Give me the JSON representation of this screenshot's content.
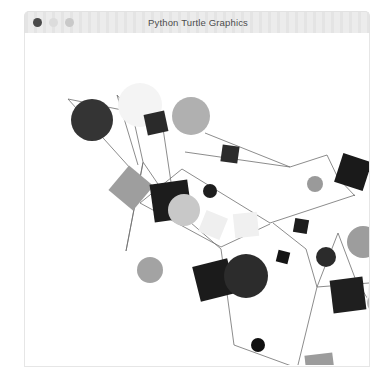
{
  "window": {
    "title": "Python Turtle Graphics",
    "controls": [
      {
        "name": "close",
        "color": "#4a4a4a"
      },
      {
        "name": "minimize",
        "color": "#dcdcdc"
      },
      {
        "name": "maximize",
        "color": "#c9c9c9"
      }
    ],
    "background": "#ffffff",
    "titlebar_color": "#ececec"
  },
  "chart_data": {
    "type": "scatter",
    "title": "Python Turtle Graphics",
    "xlabel": "",
    "ylabel": "",
    "xlim": [
      0,
      344
    ],
    "ylim": [
      0,
      332
    ],
    "grid": false,
    "legend": "none",
    "palette": [
      "#000000",
      "#2e2e2e",
      "#3a3a3a",
      "#7d7d7d",
      "#9a9a9a",
      "#b5b5b5",
      "#cfcfcf",
      "#e8e8e8",
      "#f2f2f2"
    ],
    "edges": [
      {
        "from": [
          43,
          66
        ],
        "to": [
          107,
          79
        ]
      },
      {
        "from": [
          107,
          79
        ],
        "to": [
          92,
          62
        ]
      },
      {
        "from": [
          107,
          79
        ],
        "to": [
          136,
          82
        ]
      },
      {
        "from": [
          107,
          79
        ],
        "to": [
          118,
          129
        ]
      },
      {
        "from": [
          43,
          66
        ],
        "to": [
          115,
          146
        ]
      },
      {
        "from": [
          92,
          62
        ],
        "to": [
          113,
          132
        ]
      },
      {
        "from": [
          136,
          82
        ],
        "to": [
          150,
          176
        ]
      },
      {
        "from": [
          118,
          129
        ],
        "to": [
          101,
          218
        ]
      },
      {
        "from": [
          101,
          218
        ],
        "to": [
          118,
          130
        ]
      },
      {
        "from": [
          180,
          100
        ],
        "to": [
          265,
          134
        ]
      },
      {
        "from": [
          265,
          134
        ],
        "to": [
          302,
          122
        ]
      },
      {
        "from": [
          265,
          134
        ],
        "to": [
          160,
          119
        ]
      },
      {
        "from": [
          302,
          122
        ],
        "to": [
          313,
          145
        ]
      },
      {
        "from": [
          313,
          145
        ],
        "to": [
          330,
          163
        ]
      },
      {
        "from": [
          157,
          136
        ],
        "to": [
          245,
          190
        ]
      },
      {
        "from": [
          245,
          190
        ],
        "to": [
          330,
          162
        ]
      },
      {
        "from": [
          157,
          136
        ],
        "to": [
          115,
          170
        ]
      },
      {
        "from": [
          115,
          170
        ],
        "to": [
          196,
          214
        ]
      },
      {
        "from": [
          196,
          214
        ],
        "to": [
          245,
          191
        ]
      },
      {
        "from": [
          150,
          176
        ],
        "to": [
          196,
          216
        ]
      },
      {
        "from": [
          196,
          216
        ],
        "to": [
          209,
          312
        ]
      },
      {
        "from": [
          209,
          312
        ],
        "to": [
          272,
          335
        ]
      },
      {
        "from": [
          248,
          190
        ],
        "to": [
          281,
          216
        ]
      },
      {
        "from": [
          281,
          216
        ],
        "to": [
          292,
          254
        ]
      },
      {
        "from": [
          292,
          254
        ],
        "to": [
          313,
          200
        ]
      },
      {
        "from": [
          313,
          200
        ],
        "to": [
          330,
          245
        ]
      },
      {
        "from": [
          292,
          254
        ],
        "to": [
          272,
          336
        ]
      },
      {
        "from": [
          292,
          254
        ],
        "to": [
          344,
          250
        ]
      },
      {
        "from": [
          330,
          245
        ],
        "to": [
          344,
          268
        ]
      },
      {
        "from": [
          118,
          129
        ],
        "to": [
          150,
          176
        ]
      }
    ],
    "shapes": [
      {
        "kind": "circle",
        "cx": 67,
        "cy": 87,
        "r": 21,
        "color": "#343434"
      },
      {
        "kind": "circle",
        "cx": 115,
        "cy": 72,
        "r": 22,
        "color": "#f4f4f4"
      },
      {
        "kind": "circle",
        "cx": 166,
        "cy": 83,
        "r": 19,
        "color": "#b0b0b0"
      },
      {
        "kind": "square",
        "cx": 131,
        "cy": 90,
        "size": 21,
        "rot": -12,
        "color": "#2a2a2a"
      },
      {
        "kind": "square",
        "cx": 106,
        "cy": 155,
        "size": 32,
        "rot": 40,
        "color": "#9e9e9e"
      },
      {
        "kind": "square",
        "cx": 146,
        "cy": 168,
        "size": 38,
        "rot": -8,
        "color": "#1c1c1c"
      },
      {
        "kind": "circle",
        "cx": 159,
        "cy": 177,
        "r": 16,
        "color": "#c8c8c8"
      },
      {
        "kind": "square",
        "cx": 205,
        "cy": 121,
        "size": 17,
        "rot": 8,
        "color": "#2b2b2b"
      },
      {
        "kind": "circle",
        "cx": 185,
        "cy": 158,
        "r": 7,
        "color": "#1e1e1e"
      },
      {
        "kind": "circle",
        "cx": 290,
        "cy": 151,
        "r": 8,
        "color": "#9a9a9a"
      },
      {
        "kind": "square",
        "cx": 328,
        "cy": 139,
        "size": 30,
        "rot": 18,
        "color": "#1a1a1a"
      },
      {
        "kind": "square",
        "cx": 360,
        "cy": 162,
        "size": 22,
        "rot": 12,
        "color": "#b5b5b5"
      },
      {
        "kind": "square",
        "cx": 188,
        "cy": 192,
        "size": 23,
        "rot": 22,
        "color": "#efefef"
      },
      {
        "kind": "square",
        "cx": 221,
        "cy": 192,
        "size": 24,
        "rot": -6,
        "color": "#f0f0f0"
      },
      {
        "kind": "square",
        "cx": 276,
        "cy": 193,
        "size": 14,
        "rot": 10,
        "color": "#1d1d1d"
      },
      {
        "kind": "circle",
        "cx": 301,
        "cy": 224,
        "r": 10,
        "color": "#2b2b2b"
      },
      {
        "kind": "circle",
        "cx": 338,
        "cy": 209,
        "r": 16,
        "color": "#9d9d9d"
      },
      {
        "kind": "circle",
        "cx": 125,
        "cy": 237,
        "r": 13,
        "color": "#a3a3a3"
      },
      {
        "kind": "square",
        "cx": 189,
        "cy": 247,
        "size": 36,
        "rot": -14,
        "color": "#1b1b1b"
      },
      {
        "kind": "circle",
        "cx": 221,
        "cy": 243,
        "r": 22,
        "color": "#2c2c2c"
      },
      {
        "kind": "square",
        "cx": 258,
        "cy": 224,
        "size": 12,
        "rot": 14,
        "color": "#151515"
      },
      {
        "kind": "square",
        "cx": 323,
        "cy": 262,
        "size": 33,
        "rot": -7,
        "color": "#1f1f1f"
      },
      {
        "kind": "square",
        "cx": 356,
        "cy": 258,
        "size": 26,
        "rot": 9,
        "color": "#f1f1f1"
      },
      {
        "kind": "circle",
        "cx": 351,
        "cy": 270,
        "r": 9,
        "color": "#b7b7b7"
      },
      {
        "kind": "circle",
        "cx": 233,
        "cy": 312,
        "r": 7,
        "color": "#101010"
      },
      {
        "kind": "square",
        "cx": 295,
        "cy": 335,
        "size": 28,
        "rot": -7,
        "color": "#9c9c9c"
      }
    ]
  }
}
